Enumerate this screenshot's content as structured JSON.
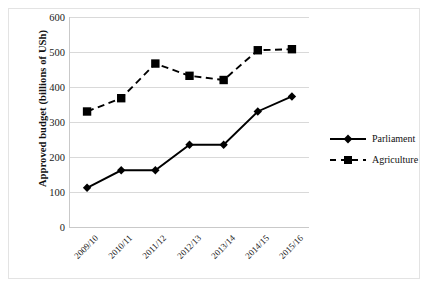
{
  "chart_data": {
    "type": "line",
    "title": "",
    "xlabel": "",
    "ylabel": "Approved budget (billions of USh)",
    "categories": [
      "2009/10",
      "2010/11",
      "2011/12",
      "2012/13",
      "2013/14",
      "2014/15",
      "2015/16"
    ],
    "ylim": [
      0,
      600
    ],
    "yticks": [
      0,
      100,
      200,
      300,
      400,
      500,
      600
    ],
    "ytick_labels": [
      "0",
      "100",
      "200",
      "300",
      "400",
      "500",
      "600"
    ],
    "grid": "horizontal",
    "legend_position": "right",
    "series": [
      {
        "name": "Parliament",
        "values": [
          112,
          162,
          162,
          235,
          235,
          330,
          373
        ],
        "line_style": "solid",
        "marker": "diamond",
        "color": "#000000"
      },
      {
        "name": "Agriculture",
        "values": [
          330,
          368,
          467,
          432,
          420,
          505,
          508
        ],
        "line_style": "dashed",
        "marker": "square",
        "color": "#000000"
      }
    ]
  },
  "legend": {
    "items": [
      {
        "label": "Parliament",
        "marker": "diamond-marker",
        "line_style": "solid"
      },
      {
        "label": "Agriculture",
        "marker": "square-marker",
        "line_style": "dashed"
      }
    ]
  },
  "colors": {
    "series": "#000000",
    "gridline": "#d9d9d9",
    "axis": "#c9c9c9",
    "border": "#e3e3e3",
    "text": "#111111",
    "background": "#ffffff"
  }
}
